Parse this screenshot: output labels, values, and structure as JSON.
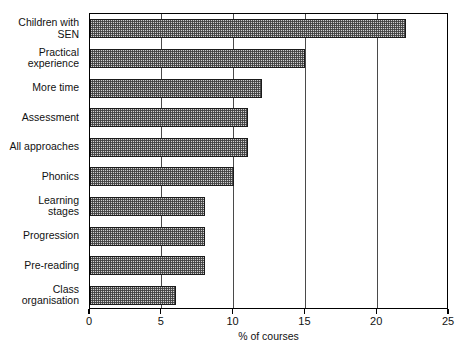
{
  "chart_data": {
    "type": "bar",
    "orientation": "horizontal",
    "title": "",
    "xlabel": "% of courses",
    "ylabel": "",
    "xlim": [
      0,
      25
    ],
    "xticks": [
      0,
      5,
      10,
      15,
      20,
      25
    ],
    "xticklabels": [
      "0",
      "5",
      "10",
      "15",
      "20",
      "25"
    ],
    "grid": "vertical",
    "legend": "none",
    "categories": [
      "Children with SEN",
      "Practical experience",
      "More time",
      "Assessment",
      "All approaches",
      "Phonics",
      "Learning stages",
      "Progression",
      "Pre-reading",
      "Class organisation"
    ],
    "category_lines": [
      [
        "Children with",
        "SEN"
      ],
      [
        "Practical",
        "experience"
      ],
      [
        "More time"
      ],
      [
        "Assessment"
      ],
      [
        "All approaches"
      ],
      [
        "Phonics"
      ],
      [
        "Learning",
        "stages"
      ],
      [
        "Progression"
      ],
      [
        "Pre-reading"
      ],
      [
        "Class",
        "organisation"
      ]
    ],
    "values": [
      22,
      15,
      12,
      11,
      11,
      10,
      8,
      8,
      8,
      6
    ],
    "bar_fill": "#cfcfcf",
    "bar_edge": "#1a1a1a",
    "axis_color": "#000000"
  }
}
